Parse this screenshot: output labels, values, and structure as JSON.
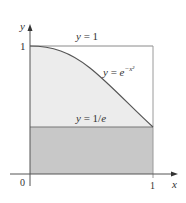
{
  "figure": {
    "axes": {
      "x_label": "x",
      "y_label": "y",
      "origin_label": "0",
      "x_tick_label": "1",
      "y_tick_label": "1"
    },
    "labels": {
      "top_line": "y = 1",
      "curve": "y = e",
      "curve_exponent": "−x²",
      "bottom_line": "y = 1/e"
    },
    "colors": {
      "upper_region_fill": "#ececec",
      "lower_region_fill": "#c8c8c8",
      "line_color": "#555555",
      "box_color": "#999999"
    }
  }
}
